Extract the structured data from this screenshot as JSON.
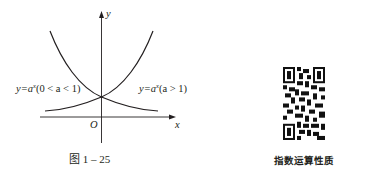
{
  "figure": {
    "caption": "图 1 – 25",
    "axis_labels": {
      "x": "x",
      "y": "y",
      "origin": "O"
    },
    "curves": [
      {
        "id": "decay",
        "label_prefix": "y=a",
        "label_exp": "x",
        "label_suffix": "(0 < a < 1)",
        "condition": "0 < a < 1",
        "shape": "decreasing"
      },
      {
        "id": "growth",
        "label_prefix": "y=a",
        "label_exp": "x",
        "label_suffix": "(a > 1)",
        "condition": "a > 1",
        "shape": "increasing"
      }
    ],
    "intersection": {
      "x": 0,
      "y": 1
    }
  },
  "qr": {
    "caption": "指数运算性质"
  },
  "colors": {
    "ink": "#231f20",
    "background": "#ffffff"
  }
}
